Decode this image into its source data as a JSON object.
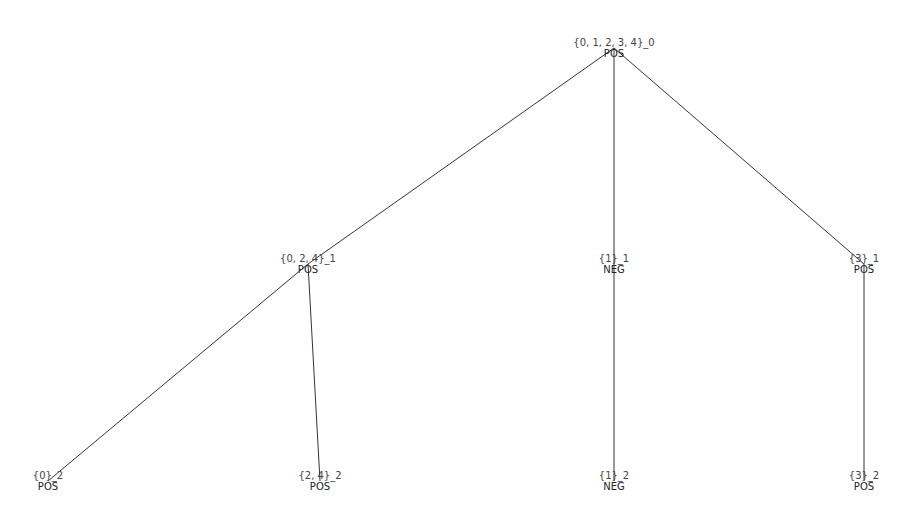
{
  "diagram": {
    "type": "tree",
    "edge_color": "#333333",
    "nodes": [
      {
        "id": "n0",
        "set": "{0, 1, 2, 3, 4}_0",
        "label": "POS",
        "level": 0,
        "x": 614,
        "y": 48
      },
      {
        "id": "n1",
        "set": "{0, 2, 4}_1",
        "label": "POS",
        "level": 1,
        "x": 308,
        "y": 264
      },
      {
        "id": "n2",
        "set": "{1}_1",
        "label": "NEG",
        "level": 1,
        "x": 614,
        "y": 264
      },
      {
        "id": "n3",
        "set": "{3}_1",
        "label": "POS",
        "level": 1,
        "x": 864,
        "y": 264
      },
      {
        "id": "n4",
        "set": "{0}_2",
        "label": "POS",
        "level": 2,
        "x": 48,
        "y": 481
      },
      {
        "id": "n5",
        "set": "{2, 4}_2",
        "label": "POS",
        "level": 2,
        "x": 320,
        "y": 481
      },
      {
        "id": "n6",
        "set": "{1}_2",
        "label": "NEG",
        "level": 2,
        "x": 614,
        "y": 481
      },
      {
        "id": "n7",
        "set": "{3}_2",
        "label": "POS",
        "level": 2,
        "x": 864,
        "y": 481
      }
    ],
    "edges": [
      {
        "from": "n0",
        "to": "n1"
      },
      {
        "from": "n0",
        "to": "n2"
      },
      {
        "from": "n0",
        "to": "n3"
      },
      {
        "from": "n1",
        "to": "n4"
      },
      {
        "from": "n1",
        "to": "n5"
      },
      {
        "from": "n2",
        "to": "n6"
      },
      {
        "from": "n3",
        "to": "n7"
      }
    ]
  }
}
